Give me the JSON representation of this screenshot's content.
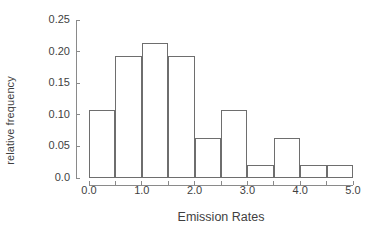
{
  "chart_data": {
    "type": "bar",
    "title": "",
    "xlabel": "Emission Rates",
    "ylabel": "relative frequency",
    "xlim": [
      0.0,
      5.0
    ],
    "ylim": [
      0.0,
      0.25
    ],
    "grid": false,
    "legend": null,
    "bin_width": 0.5,
    "bin_edges": [
      0.0,
      0.5,
      1.0,
      1.5,
      2.0,
      2.5,
      3.0,
      3.5,
      4.0,
      4.5,
      5.0
    ],
    "categories": [
      "0.0-0.5",
      "0.5-1.0",
      "1.0-1.5",
      "1.5-2.0",
      "2.0-2.5",
      "2.5-3.0",
      "3.0-3.5",
      "3.5-4.0",
      "4.0-4.5",
      "4.5-5.0"
    ],
    "values": [
      0.107,
      0.193,
      0.214,
      0.193,
      0.064,
      0.107,
      0.021,
      0.064,
      0.021,
      0.021
    ],
    "xticks": [
      0.0,
      0.5,
      1.0,
      1.5,
      2.0,
      2.5,
      3.0,
      3.5,
      4.0,
      4.5,
      5.0
    ],
    "xtick_labels": [
      "0.0",
      "",
      "1.0",
      "",
      "2.0",
      "",
      "3.0",
      "",
      "4.0",
      "",
      "5.0"
    ],
    "yticks": [
      0.0,
      0.05,
      0.1,
      0.15,
      0.2,
      0.25
    ],
    "ytick_labels": [
      "0.0",
      "0.05",
      "0.10",
      "0.15",
      "0.20",
      "0.25"
    ],
    "bar_edge_color": "#6e6e6e",
    "bar_fill_color": "#ffffff",
    "axis_color": "#8a8a8a",
    "text_color": "#3f3f3f"
  }
}
